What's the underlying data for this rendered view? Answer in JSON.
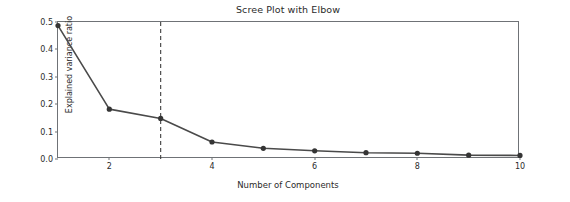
{
  "chart_data": {
    "type": "line",
    "title": "Scree Plot with Elbow",
    "xlabel": "Number of Components",
    "ylabel": "Explained variance ratio",
    "x": [
      1,
      2,
      3,
      4,
      5,
      6,
      7,
      8,
      9,
      10
    ],
    "values": [
      0.487,
      0.182,
      0.148,
      0.062,
      0.039,
      0.03,
      0.023,
      0.021,
      0.014,
      0.013
    ],
    "series": [
      {
        "name": "Explained variance ratio",
        "values": [
          0.487,
          0.182,
          0.148,
          0.062,
          0.039,
          0.03,
          0.023,
          0.021,
          0.014,
          0.013
        ]
      }
    ],
    "xlim": [
      1,
      10
    ],
    "ylim": [
      0.0,
      0.5
    ],
    "xticks": [
      2,
      4,
      6,
      8,
      10
    ],
    "xticklabels": [
      "2",
      "4",
      "6",
      "8",
      "10"
    ],
    "yticks": [
      0.0,
      0.1,
      0.2,
      0.3,
      0.4,
      0.5
    ],
    "yticklabels": [
      "0.0",
      "0.1",
      "0.2",
      "0.3",
      "0.4",
      "0.5"
    ],
    "grid": false,
    "legend": null,
    "annotations": [
      {
        "type": "vertical-line",
        "name": "elbow-line",
        "x": 3,
        "style": "dashed",
        "color": "#3f3f3f"
      }
    ],
    "marker": "circle",
    "line_color": "#4a4a4a",
    "marker_color": "#353535"
  },
  "figure": {
    "background": "#ffffff",
    "axes_color": "#6f7276",
    "text_color": "#2b2b2b"
  }
}
